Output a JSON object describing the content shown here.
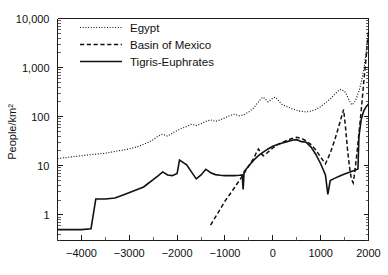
{
  "chart_data": {
    "type": "line",
    "title": "",
    "xlabel": "",
    "ylabel": "People/km²",
    "yscale": "log",
    "xlim": [
      -4500,
      2000
    ],
    "ylim": [
      0.3,
      10000
    ],
    "grid": false,
    "legend_position": "top-left-inside",
    "x_ticks": [
      -4000,
      -3000,
      -2000,
      -1000,
      0,
      1000,
      2000
    ],
    "x_tick_labels": [
      "−4000",
      "−3000",
      "−2000",
      "−1000",
      "0",
      "1000",
      "2000"
    ],
    "x_minor_ticks": [
      -4500,
      -3500,
      -2500,
      -1500,
      -500,
      500,
      1500
    ],
    "y_ticks": [
      1,
      10,
      100,
      1000,
      10000
    ],
    "y_tick_labels": [
      "1",
      "10",
      "100",
      "1,000",
      "10,000"
    ],
    "series": [
      {
        "name": "Egypt",
        "style": "dotted",
        "points": [
          [
            -4500,
            14
          ],
          [
            -4250,
            15
          ],
          [
            -4000,
            16
          ],
          [
            -3750,
            17
          ],
          [
            -3500,
            18
          ],
          [
            -3250,
            20
          ],
          [
            -3000,
            22
          ],
          [
            -2800,
            25
          ],
          [
            -2600,
            30
          ],
          [
            -2500,
            34
          ],
          [
            -2400,
            40
          ],
          [
            -2300,
            44
          ],
          [
            -2200,
            40
          ],
          [
            -2100,
            46
          ],
          [
            -2000,
            52
          ],
          [
            -1900,
            58
          ],
          [
            -1800,
            63
          ],
          [
            -1700,
            70
          ],
          [
            -1600,
            66
          ],
          [
            -1500,
            72
          ],
          [
            -1400,
            80
          ],
          [
            -1300,
            86
          ],
          [
            -1200,
            80
          ],
          [
            -1100,
            86
          ],
          [
            -1000,
            95
          ],
          [
            -900,
            105
          ],
          [
            -800,
            112
          ],
          [
            -700,
            104
          ],
          [
            -600,
            110
          ],
          [
            -500,
            125
          ],
          [
            -400,
            150
          ],
          [
            -350,
            175
          ],
          [
            -300,
            200
          ],
          [
            -250,
            230
          ],
          [
            -200,
            250
          ],
          [
            -150,
            225
          ],
          [
            -100,
            200
          ],
          [
            -50,
            215
          ],
          [
            0,
            240
          ],
          [
            50,
            250
          ],
          [
            100,
            225
          ],
          [
            150,
            195
          ],
          [
            200,
            175
          ],
          [
            300,
            160
          ],
          [
            400,
            145
          ],
          [
            500,
            135
          ],
          [
            600,
            128
          ],
          [
            700,
            125
          ],
          [
            800,
            130
          ],
          [
            900,
            140
          ],
          [
            1000,
            160
          ],
          [
            1100,
            190
          ],
          [
            1200,
            230
          ],
          [
            1300,
            290
          ],
          [
            1400,
            360
          ],
          [
            1500,
            330
          ],
          [
            1550,
            270
          ],
          [
            1600,
            210
          ],
          [
            1650,
            175
          ],
          [
            1700,
            190
          ],
          [
            1750,
            240
          ],
          [
            1800,
            330
          ],
          [
            1850,
            500
          ],
          [
            1900,
            900
          ],
          [
            1950,
            2000
          ],
          [
            1980,
            4000
          ],
          [
            2000,
            6000
          ]
        ]
      },
      {
        "name": "Basin of Mexico",
        "style": "dashed",
        "points": [
          [
            -1300,
            0.62
          ],
          [
            -1200,
            0.9
          ],
          [
            -1100,
            1.3
          ],
          [
            -1000,
            1.9
          ],
          [
            -900,
            2.6
          ],
          [
            -800,
            3.6
          ],
          [
            -700,
            5.0
          ],
          [
            -600,
            7.0
          ],
          [
            -500,
            10
          ],
          [
            -400,
            14
          ],
          [
            -350,
            18
          ],
          [
            -300,
            22
          ],
          [
            -250,
            18
          ],
          [
            -200,
            16
          ],
          [
            -150,
            17
          ],
          [
            -100,
            19
          ],
          [
            0,
            23
          ],
          [
            100,
            27
          ],
          [
            200,
            30
          ],
          [
            300,
            33
          ],
          [
            400,
            36
          ],
          [
            500,
            38
          ],
          [
            600,
            36
          ],
          [
            700,
            32
          ],
          [
            800,
            27
          ],
          [
            900,
            21
          ],
          [
            1000,
            15
          ],
          [
            1100,
            11
          ],
          [
            1200,
            18
          ],
          [
            1300,
            35
          ],
          [
            1400,
            75
          ],
          [
            1480,
            140
          ],
          [
            1520,
            60
          ],
          [
            1560,
            22
          ],
          [
            1600,
            10
          ],
          [
            1640,
            5.5
          ],
          [
            1680,
            4.5
          ],
          [
            1700,
            6
          ],
          [
            1750,
            15
          ],
          [
            1800,
            45
          ],
          [
            1850,
            140
          ],
          [
            1900,
            500
          ],
          [
            1950,
            1600
          ],
          [
            1980,
            3500
          ],
          [
            2000,
            5200
          ]
        ]
      },
      {
        "name": "Tigris-Euphrates",
        "style": "solid",
        "points": [
          [
            -4500,
            0.5
          ],
          [
            -4200,
            0.5
          ],
          [
            -4000,
            0.5
          ],
          [
            -3800,
            0.52
          ],
          [
            -3700,
            2.1
          ],
          [
            -3500,
            2.1
          ],
          [
            -3300,
            2.2
          ],
          [
            -3100,
            2.6
          ],
          [
            -2900,
            3.1
          ],
          [
            -2700,
            3.7
          ],
          [
            -2600,
            4.4
          ],
          [
            -2500,
            5.2
          ],
          [
            -2400,
            6.2
          ],
          [
            -2300,
            7.5
          ],
          [
            -2200,
            6.5
          ],
          [
            -2100,
            6.3
          ],
          [
            -2000,
            7.0
          ],
          [
            -1950,
            13.0
          ],
          [
            -1800,
            10.5
          ],
          [
            -1700,
            7.5
          ],
          [
            -1600,
            5.4
          ],
          [
            -1500,
            6.5
          ],
          [
            -1400,
            8.5
          ],
          [
            -1300,
            7.2
          ],
          [
            -1200,
            6.6
          ],
          [
            -1100,
            6.4
          ],
          [
            -1000,
            6.3
          ],
          [
            -900,
            6.3
          ],
          [
            -800,
            6.3
          ],
          [
            -700,
            6.4
          ],
          [
            -640,
            6.5
          ],
          [
            -620,
            3.3
          ],
          [
            -600,
            7.5
          ],
          [
            -500,
            10
          ],
          [
            -400,
            13
          ],
          [
            -300,
            16
          ],
          [
            -200,
            19
          ],
          [
            -100,
            22
          ],
          [
            0,
            25
          ],
          [
            100,
            27
          ],
          [
            200,
            29
          ],
          [
            300,
            31
          ],
          [
            400,
            33
          ],
          [
            500,
            34
          ],
          [
            600,
            31
          ],
          [
            700,
            30
          ],
          [
            800,
            24
          ],
          [
            900,
            17
          ],
          [
            1000,
            11
          ],
          [
            1100,
            6.5
          ],
          [
            1150,
            2.6
          ],
          [
            1200,
            5.0
          ],
          [
            1300,
            5.6
          ],
          [
            1400,
            6.2
          ],
          [
            1500,
            6.8
          ],
          [
            1600,
            7.4
          ],
          [
            1700,
            8.0
          ],
          [
            1780,
            8.6
          ],
          [
            1800,
            40
          ],
          [
            1850,
            90
          ],
          [
            1900,
            130
          ],
          [
            1950,
            160
          ],
          [
            2000,
            180
          ]
        ]
      }
    ],
    "legend": [
      {
        "label": "Egypt",
        "style": "dotted"
      },
      {
        "label": "Basin of Mexico",
        "style": "dashed"
      },
      {
        "label": "Tigris-Euphrates",
        "style": "solid"
      }
    ]
  }
}
